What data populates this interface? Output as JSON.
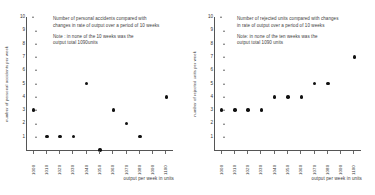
{
  "charts": [
    {
      "id": "personal-accidents",
      "title_line1": "Number of personal accidents compared with",
      "title_line2": "changes in rate of output over a period of 10 weeks",
      "note_line1": "Note : in none of the 10 weeks was the",
      "note_line2": "output total 1090units",
      "ylabel": "number of personal accidents per week",
      "xlabel": "output per week in units"
    },
    {
      "id": "rejected-units",
      "title_line1": "Number of rejected units compared with changes",
      "title_line2": "in rate of output over a period of 10 weeks",
      "note_line1": "Note: in none of the ten weeks was the",
      "note_line2": "output total 1090 units",
      "ylabel": "number of rejected units per week",
      "xlabel": "output per week in units"
    }
  ],
  "chart_data": [
    {
      "type": "scatter",
      "title": "Number of personal accidents compared with changes in rate of output over a period of 10 weeks",
      "annotation": "Note : in none of the 10 weeks was the output total 1090units",
      "xlabel": "output per week in units",
      "ylabel": "number of personal accidents per week",
      "xticks": [
        1000,
        1010,
        1020,
        1030,
        1040,
        1050,
        1060,
        1070,
        1080,
        1090,
        1100
      ],
      "yticks": [
        1,
        2,
        3,
        4,
        5,
        6,
        7,
        8,
        9,
        10
      ],
      "xlim": [
        995,
        1105
      ],
      "ylim": [
        0,
        10
      ],
      "grid": false,
      "x": [
        1000,
        1010,
        1020,
        1030,
        1040,
        1050,
        1060,
        1070,
        1080,
        1100
      ],
      "y": [
        3,
        1,
        1,
        1,
        5,
        0,
        3,
        2,
        1,
        4
      ],
      "marker": "filled-circle",
      "color": "#111111"
    },
    {
      "type": "scatter",
      "title": "Number of rejected units compared with changes in rate of output over a period of 10 weeks",
      "annotation": "Note: in none of the ten weeks was the output total 1090 units",
      "xlabel": "output per week in units",
      "ylabel": "number of rejected units per week",
      "xticks": [
        1000,
        1010,
        1020,
        1030,
        1040,
        1050,
        1060,
        1070,
        1080,
        1090,
        1100
      ],
      "yticks": [
        1,
        2,
        3,
        4,
        5,
        6,
        7,
        8,
        9,
        10
      ],
      "xlim": [
        995,
        1105
      ],
      "ylim": [
        0,
        10
      ],
      "grid": false,
      "x": [
        1000,
        1010,
        1020,
        1030,
        1040,
        1050,
        1060,
        1070,
        1080,
        1100
      ],
      "y": [
        3,
        3,
        3,
        3,
        4,
        4,
        4,
        5,
        5,
        7
      ],
      "marker": "filled-circle",
      "color": "#111111"
    }
  ]
}
